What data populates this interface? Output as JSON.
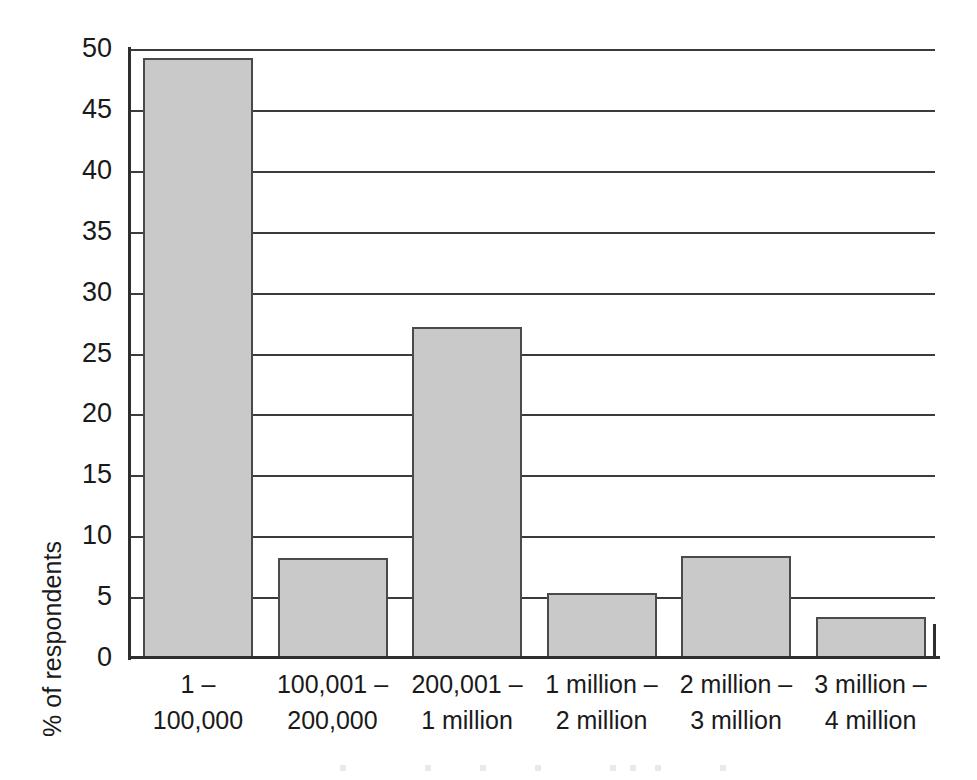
{
  "chart_data": {
    "type": "bar",
    "title": "",
    "subtitle": "",
    "xlabel": "",
    "ylabel": "% of respondents",
    "ylim": [
      0,
      50
    ],
    "yticks": [
      0,
      5,
      10,
      15,
      20,
      25,
      30,
      35,
      40,
      45,
      50
    ],
    "ytick_labels": [
      "0",
      "5",
      "10",
      "15",
      "20",
      "25",
      "30",
      "35",
      "40",
      "45",
      "50"
    ],
    "grid": true,
    "legend": false,
    "legend_position": "none",
    "bar_color": "#c9c9c9",
    "bar_edge_color": "#4a4a4a",
    "axis_color": "#2e2e2e",
    "categories": [
      "1 – 100,000",
      "100,001 – 200,000",
      "200,001 – 1 million",
      "1 million – 2 million",
      "2 million – 3 million",
      "3 million – 4 million"
    ],
    "category_lines": [
      {
        "line1": "1 –",
        "line2": "100,000"
      },
      {
        "line1": "100,001 –",
        "line2": "200,000"
      },
      {
        "line1": "200,001 –",
        "line2": "1 million"
      },
      {
        "line1": "1 million –",
        "line2": "2 million"
      },
      {
        "line1": "2 million –",
        "line2": "3 million"
      },
      {
        "line1": "3 million –",
        "line2": "4 million"
      }
    ],
    "values": [
      49.3,
      8.2,
      27.2,
      5.3,
      8.4,
      3.4
    ]
  }
}
